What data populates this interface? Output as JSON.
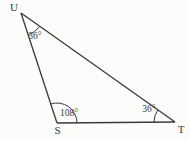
{
  "figure": {
    "type": "triangle-angle-diagram",
    "vertices": [
      {
        "id": "U",
        "label": "U",
        "position": "top-left"
      },
      {
        "id": "S",
        "label": "S",
        "position": "bottom-left"
      },
      {
        "id": "T",
        "label": "T",
        "position": "bottom-right"
      }
    ],
    "angles": [
      {
        "vertex": "U",
        "label": "36°",
        "value_degrees": 36
      },
      {
        "vertex": "S",
        "label": "108°",
        "value_degrees": 108
      },
      {
        "vertex": "T",
        "label": "36°",
        "value_degrees": 36
      }
    ],
    "colors": {
      "line": "#3a3a3a",
      "text": "#3a3a3a",
      "background": "#fcfcfb"
    }
  }
}
